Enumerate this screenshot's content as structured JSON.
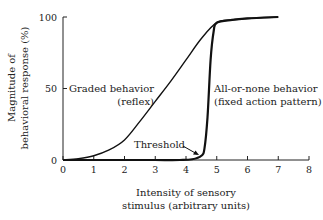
{
  "chart_data": {
    "type": "line",
    "title": "",
    "xlabel": [
      "Intensity of sensory",
      "stimulus (arbitrary units)"
    ],
    "ylabel": [
      "Magnitude of",
      "behavioral response (%)"
    ],
    "xlim": [
      0,
      8
    ],
    "ylim": [
      0,
      100
    ],
    "x_ticks": [
      0,
      1,
      2,
      3,
      4,
      5,
      6,
      7,
      8
    ],
    "y_ticks": [
      0,
      50,
      100
    ],
    "grid": false,
    "legend": null,
    "series": [
      {
        "name": "Graded behavior (reflex)",
        "x": [
          0,
          0.5,
          1,
          1.5,
          2,
          2.5,
          3,
          3.5,
          4,
          4.5,
          5,
          5.5,
          6,
          6.5,
          7
        ],
        "y": [
          0,
          1,
          3,
          7,
          14,
          27,
          41,
          55,
          70,
          85,
          96,
          98,
          99,
          99.5,
          100
        ]
      },
      {
        "name": "All-or-none behavior (fixed action pattern)",
        "x": [
          0,
          1,
          2,
          3,
          3.8,
          4.2,
          4.5,
          4.6,
          4.7,
          4.8,
          4.9,
          5,
          5.5,
          6,
          7
        ],
        "y": [
          0,
          0,
          0,
          0,
          0,
          0.5,
          3,
          8,
          30,
          70,
          90,
          96,
          98,
          99,
          100
        ]
      }
    ],
    "annotations": [
      {
        "text": [
          "Graded behavior",
          "(reflex)"
        ],
        "target": "Graded behavior curve"
      },
      {
        "text": [
          "All-or-none behavior",
          "(fixed action pattern)"
        ],
        "target": "All-or-none curve"
      },
      {
        "text": "Threshold",
        "x": 4.5,
        "y": 2,
        "arrow": true
      }
    ]
  }
}
